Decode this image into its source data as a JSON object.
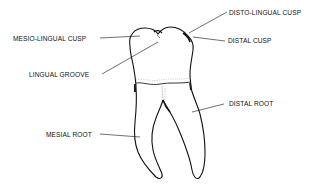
{
  "figure": {
    "colors": {
      "background": "#ffffff",
      "ink": "#111111"
    },
    "labels": [
      {
        "id": "disto-lingual-cusp",
        "text": "DISTO-LINGUAL CUSP"
      },
      {
        "id": "mesio-lingual-cusp",
        "text": "MESIO-LINGUAL CUSP"
      },
      {
        "id": "distal-cusp",
        "text": "DISTAL  CUSP"
      },
      {
        "id": "lingual-groove",
        "text": "LINGUAL GROOVE"
      },
      {
        "id": "distal-root",
        "text": "DISTAL ROOT"
      },
      {
        "id": "mesial-root",
        "text": "MESIAL ROOT"
      }
    ]
  }
}
